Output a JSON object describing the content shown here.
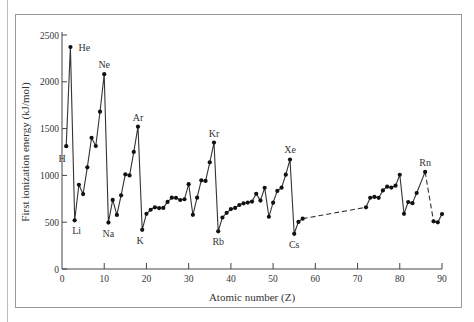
{
  "chart_data": {
    "type": "line",
    "title": "",
    "xlabel": "Atomic number (Z)",
    "ylabel": "First ionization energy (kJ/mol)",
    "xlim": [
      0,
      90
    ],
    "ylim": [
      0,
      2500
    ],
    "xticks": [
      0,
      10,
      20,
      30,
      40,
      50,
      60,
      70,
      80,
      90
    ],
    "yticks": [
      0,
      500,
      1000,
      1500,
      2000,
      2500
    ],
    "grid": false,
    "legend": null,
    "series": [
      {
        "name": "First ionization energy",
        "points": [
          [
            1,
            1312
          ],
          [
            2,
            2372
          ],
          [
            3,
            520
          ],
          [
            4,
            900
          ],
          [
            5,
            801
          ],
          [
            6,
            1086
          ],
          [
            7,
            1402
          ],
          [
            8,
            1314
          ],
          [
            9,
            1681
          ],
          [
            10,
            2081
          ],
          [
            11,
            496
          ],
          [
            12,
            738
          ],
          [
            13,
            578
          ],
          [
            14,
            787
          ],
          [
            15,
            1012
          ],
          [
            16,
            1000
          ],
          [
            17,
            1251
          ],
          [
            18,
            1521
          ],
          [
            19,
            419
          ],
          [
            20,
            590
          ],
          [
            21,
            633
          ],
          [
            22,
            659
          ],
          [
            23,
            651
          ],
          [
            24,
            653
          ],
          [
            25,
            717
          ],
          [
            26,
            762
          ],
          [
            27,
            760
          ],
          [
            28,
            737
          ],
          [
            29,
            745
          ],
          [
            30,
            906
          ],
          [
            31,
            579
          ],
          [
            32,
            762
          ],
          [
            33,
            947
          ],
          [
            34,
            941
          ],
          [
            35,
            1140
          ],
          [
            36,
            1351
          ],
          [
            37,
            403
          ],
          [
            38,
            550
          ],
          [
            39,
            600
          ],
          [
            40,
            640
          ],
          [
            41,
            652
          ],
          [
            42,
            684
          ],
          [
            43,
            702
          ],
          [
            44,
            710
          ],
          [
            45,
            720
          ],
          [
            46,
            804
          ],
          [
            47,
            731
          ],
          [
            48,
            868
          ],
          [
            49,
            558
          ],
          [
            50,
            709
          ],
          [
            51,
            834
          ],
          [
            52,
            869
          ],
          [
            53,
            1008
          ],
          [
            54,
            1170
          ],
          [
            55,
            376
          ],
          [
            56,
            503
          ],
          [
            57,
            538
          ]
        ]
      },
      {
        "name": "First ionization energy (continued)",
        "points": [
          [
            72,
            659
          ],
          [
            73,
            761
          ],
          [
            74,
            770
          ],
          [
            75,
            760
          ],
          [
            76,
            840
          ],
          [
            77,
            880
          ],
          [
            78,
            870
          ],
          [
            79,
            890
          ],
          [
            80,
            1007
          ],
          [
            81,
            589
          ],
          [
            82,
            716
          ],
          [
            83,
            703
          ],
          [
            84,
            812
          ],
          [
            86,
            1037
          ]
        ]
      },
      {
        "name": "Actinide start",
        "points": [
          [
            88,
            509
          ],
          [
            89,
            499
          ],
          [
            90,
            587
          ]
        ]
      }
    ],
    "dashed_segments": [
      [
        [
          57,
          538
        ],
        [
          72,
          659
        ]
      ],
      [
        [
          86,
          1037
        ],
        [
          88,
          509
        ]
      ]
    ],
    "annotations": [
      {
        "label": "H",
        "z": 1,
        "value": 1312
      },
      {
        "label": "He",
        "z": 2,
        "value": 2372
      },
      {
        "label": "Li",
        "z": 3,
        "value": 520
      },
      {
        "label": "Ne",
        "z": 10,
        "value": 2081
      },
      {
        "label": "Na",
        "z": 11,
        "value": 496
      },
      {
        "label": "Ar",
        "z": 18,
        "value": 1521
      },
      {
        "label": "K",
        "z": 19,
        "value": 419
      },
      {
        "label": "Kr",
        "z": 36,
        "value": 1351
      },
      {
        "label": "Rb",
        "z": 37,
        "value": 403
      },
      {
        "label": "Xe",
        "z": 54,
        "value": 1170
      },
      {
        "label": "Cs",
        "z": 55,
        "value": 376
      },
      {
        "label": "Rn",
        "z": 86,
        "value": 1037
      }
    ]
  }
}
